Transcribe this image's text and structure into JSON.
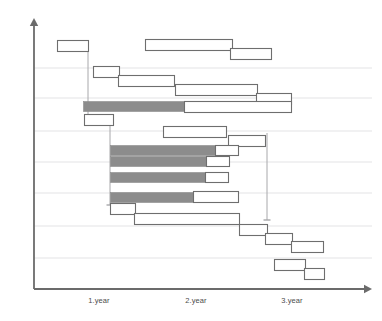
{
  "chart_data": {
    "type": "bar",
    "title": "",
    "subtitle": "",
    "xlabel": "",
    "ylabel": "",
    "orientation": "horizontal",
    "grid": true,
    "legend_position": "none",
    "axis": {
      "x_axis_y": 289,
      "y_axis_x": 34,
      "x_axis_end": 372,
      "y_axis_top": 18,
      "arrow": true,
      "color": "#6b6b6b"
    },
    "x_ticks": [
      {
        "label": "1.year",
        "x": 99
      },
      {
        "label": "2.year",
        "x": 196
      },
      {
        "label": "3.year",
        "x": 292
      }
    ],
    "xlim": [
      34,
      372
    ],
    "gridlines_y": [
      68,
      98,
      131,
      162,
      193,
      226,
      258
    ],
    "gridline_color": "#e3e3e5",
    "colors": {
      "bar_fill_open": "#ffffff",
      "bar_fill_critical": "#8c8c8c",
      "bar_stroke": "#6e6e6e",
      "axis": "#6b6b6b",
      "grid": "#e3e3e5",
      "connector": "#a8a8ab",
      "label_text": "#4c4c4c"
    },
    "bars": [
      {
        "id": "t01",
        "x": 57,
        "w": 31,
        "y": 40,
        "h": 11,
        "fill": "open"
      },
      {
        "id": "t02",
        "x": 145,
        "w": 87,
        "y": 39,
        "h": 11,
        "fill": "open"
      },
      {
        "id": "t03",
        "x": 230,
        "w": 41,
        "y": 48,
        "h": 11,
        "fill": "open"
      },
      {
        "id": "t04",
        "x": 93,
        "w": 26,
        "y": 66,
        "h": 11,
        "fill": "open"
      },
      {
        "id": "t05",
        "x": 118,
        "w": 56,
        "y": 75,
        "h": 11,
        "fill": "open"
      },
      {
        "id": "t06",
        "x": 175,
        "w": 82,
        "y": 84,
        "h": 11,
        "fill": "open"
      },
      {
        "id": "t07",
        "x": 256,
        "w": 35,
        "y": 93,
        "h": 11,
        "fill": "open"
      },
      {
        "id": "t08",
        "x": 83,
        "w": 101,
        "y": 101,
        "h": 10,
        "fill": "critical"
      },
      {
        "id": "t09",
        "x": 184,
        "w": 107,
        "y": 101,
        "h": 11,
        "fill": "open"
      },
      {
        "id": "t10",
        "x": 84,
        "w": 29,
        "y": 114,
        "h": 11,
        "fill": "open"
      },
      {
        "id": "t11",
        "x": 163,
        "w": 63,
        "y": 126,
        "h": 11,
        "fill": "open"
      },
      {
        "id": "t12",
        "x": 228,
        "w": 37,
        "y": 135,
        "h": 11,
        "fill": "open"
      },
      {
        "id": "t13",
        "x": 110,
        "w": 105,
        "y": 145,
        "h": 10,
        "fill": "critical"
      },
      {
        "id": "t14",
        "x": 215,
        "w": 23,
        "y": 145,
        "h": 10,
        "fill": "open"
      },
      {
        "id": "t15",
        "x": 110,
        "w": 96,
        "y": 156,
        "h": 10,
        "fill": "critical"
      },
      {
        "id": "t16",
        "x": 206,
        "w": 23,
        "y": 156,
        "h": 10,
        "fill": "open"
      },
      {
        "id": "t17",
        "x": 110,
        "w": 95,
        "y": 172,
        "h": 10,
        "fill": "critical"
      },
      {
        "id": "t18",
        "x": 205,
        "w": 23,
        "y": 172,
        "h": 10,
        "fill": "open"
      },
      {
        "id": "t19",
        "x": 110,
        "w": 83,
        "y": 192,
        "h": 10,
        "fill": "critical"
      },
      {
        "id": "t20",
        "x": 193,
        "w": 45,
        "y": 191,
        "h": 11,
        "fill": "open"
      },
      {
        "id": "t21",
        "x": 110,
        "w": 25,
        "y": 203,
        "h": 11,
        "fill": "open"
      },
      {
        "id": "t22",
        "x": 134,
        "w": 105,
        "y": 213,
        "h": 11,
        "fill": "open"
      },
      {
        "id": "t23",
        "x": 239,
        "w": 28,
        "y": 224,
        "h": 11,
        "fill": "open"
      },
      {
        "id": "t24",
        "x": 265,
        "w": 27,
        "y": 233,
        "h": 11,
        "fill": "open"
      },
      {
        "id": "t25",
        "x": 291,
        "w": 32,
        "y": 241,
        "h": 11,
        "fill": "open"
      },
      {
        "id": "t26",
        "x": 274,
        "w": 31,
        "y": 259,
        "h": 11,
        "fill": "open"
      },
      {
        "id": "t27",
        "x": 304,
        "w": 20,
        "y": 268,
        "h": 11,
        "fill": "open"
      }
    ],
    "connectors": [
      {
        "id": "c1",
        "points": "88,45 88,117",
        "arrow": true
      },
      {
        "id": "c2",
        "points": "110,119 110,205",
        "arrow": true
      },
      {
        "id": "c3",
        "points": "267,133 267,220",
        "arrow": true
      }
    ]
  }
}
